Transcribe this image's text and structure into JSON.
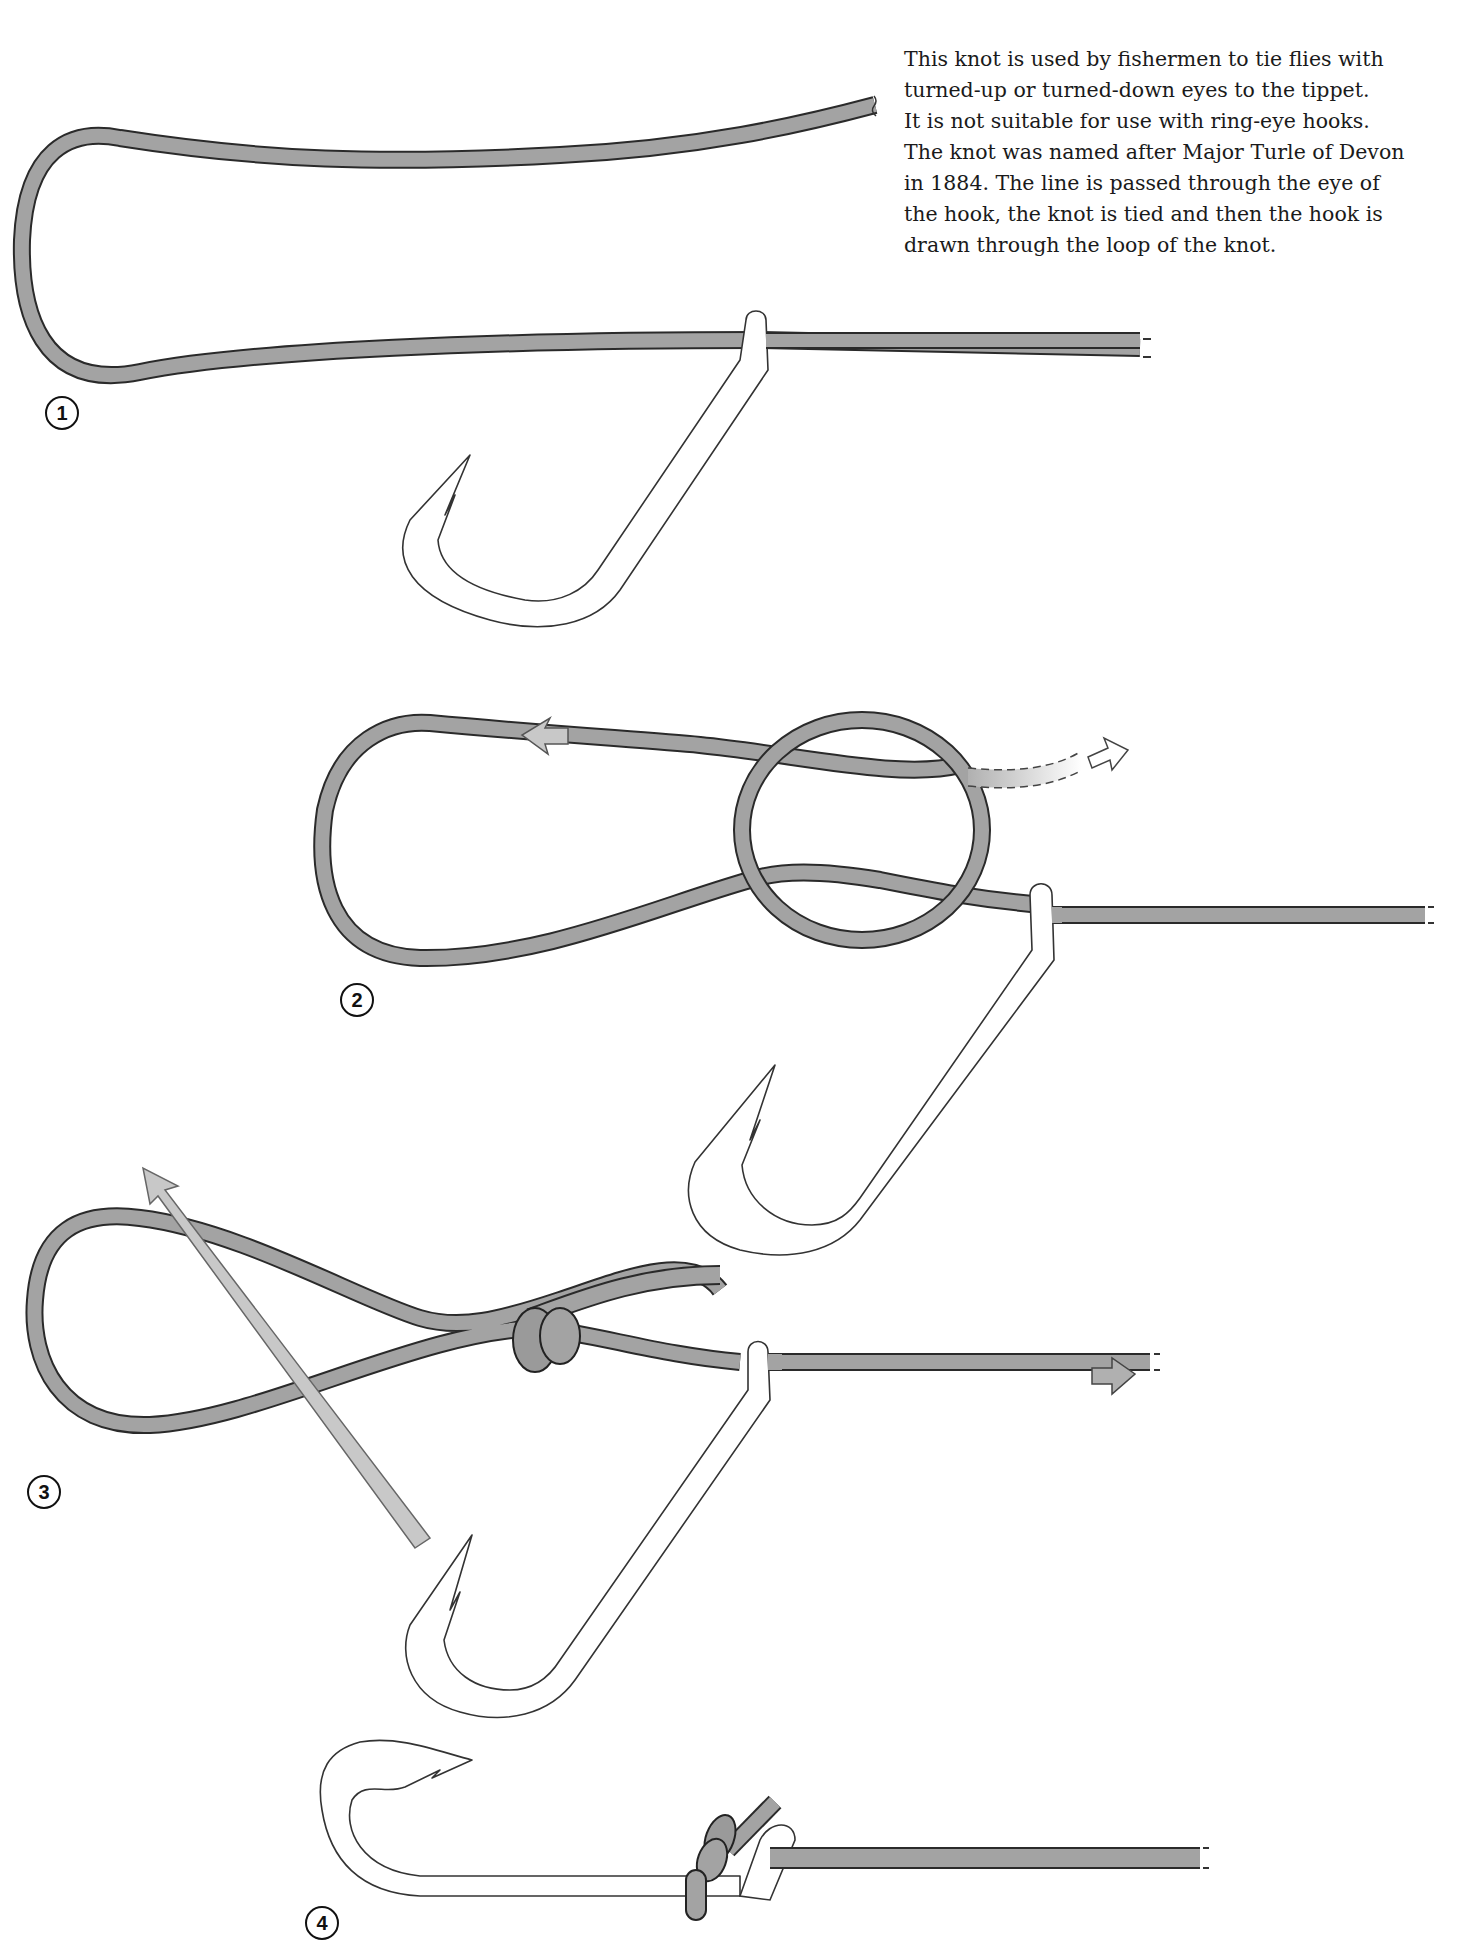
{
  "description": {
    "lines": [
      "This knot is used by fishermen to tie flies with",
      "turned-up or turned-down eyes to the tippet.",
      "It is not suitable for use with ring-eye hooks.",
      "The knot was named after Major Turle of Devon",
      "in 1884. The line is passed through the eye of",
      "the hook, the knot is tied and then the hook is",
      "drawn through the loop of the knot."
    ]
  },
  "steps": [
    {
      "label": "1",
      "description": "Line passed through the eye of the hook, forming a long loop"
    },
    {
      "label": "2",
      "description": "Overhand loop formed; working end passed through, arrows show direction"
    },
    {
      "label": "3",
      "description": "Knot tightened; hook drawn through the loop (arrow), standing line pulled"
    },
    {
      "label": "4",
      "description": "Finished knot seated behind the hook eye"
    }
  ],
  "colors": {
    "line_fill": "#a3a3a3",
    "line_outline": "#2a2a2a",
    "hook_fill": "#ffffff",
    "hook_outline": "#333333",
    "arrow_fill": "#c8c8c8",
    "text": "#1a1a1a"
  },
  "icons": {
    "direction_arrows": [
      "arrow-left-icon",
      "arrow-right-dashed-icon",
      "arrow-up-left-icon",
      "arrow-right-icon"
    ]
  }
}
